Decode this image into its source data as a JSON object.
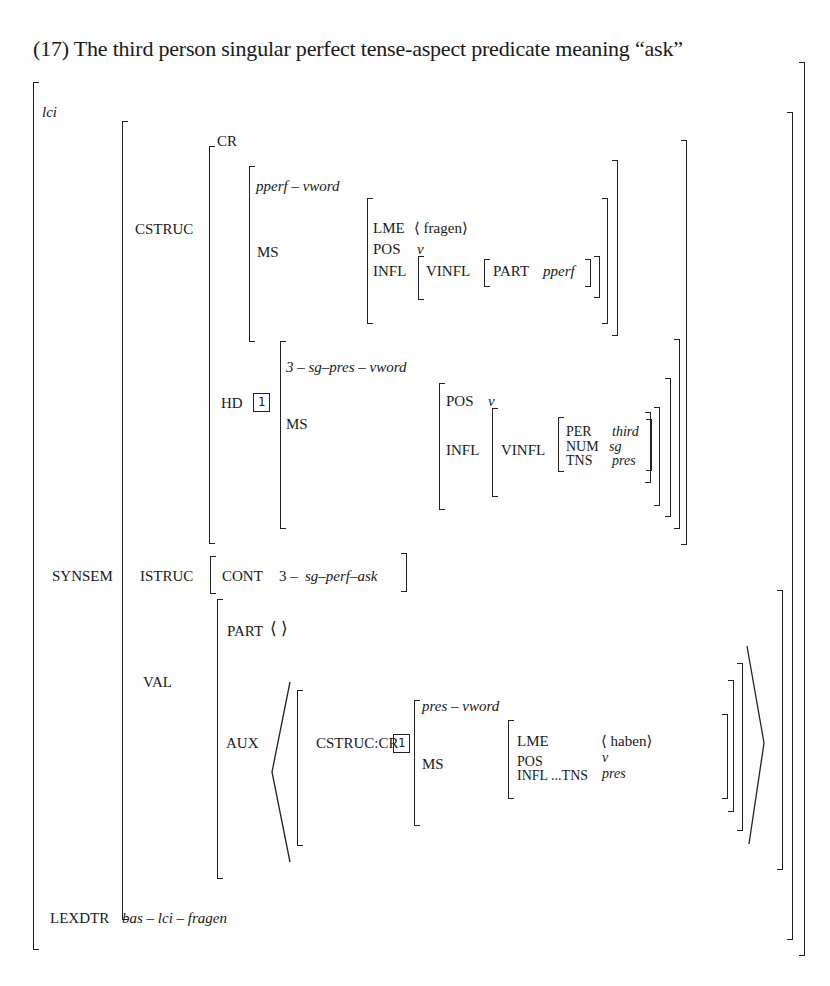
{
  "title": "(17) The third person singular perfect tense-aspect predicate meaning “ask”",
  "avm": {
    "type": "lci",
    "synsem_label": "SYNSEM",
    "cstruc": {
      "label": "CSTRUC",
      "cr": {
        "label": "CR",
        "type": "pperf – vword",
        "ms_label": "MS",
        "lme_label": "LME",
        "lme_value": "⟨ fragen⟩",
        "pos_label": "POS",
        "pos_value": "v",
        "infl_label": "INFL",
        "vinfl_label": "VINFL",
        "part_label": "PART",
        "part_value": "pperf"
      },
      "hd": {
        "label": "HD",
        "tag": "1",
        "type": "3 – sg–pres – vword",
        "ms_label": "MS",
        "pos_label": "POS",
        "pos_value": "v",
        "infl_label": "INFL",
        "vinfl_label": "VINFL",
        "per_label": "PER",
        "per_value": "third",
        "num_label": "NUM",
        "num_value": "sg",
        "tns_label": "TNS",
        "tns_value": "pres"
      }
    },
    "istruc": {
      "label": "ISTRUC",
      "cont_label": "CONT",
      "cont_prefix": "3 –",
      "cont_value": "sg–perf–ask"
    },
    "val": {
      "label": "VAL",
      "part_label": "PART",
      "part_value": "⟨ ⟩",
      "aux": {
        "label": "AUX",
        "path_label": "CSTRUC:CR",
        "tag": "1",
        "type": "pres – vword",
        "ms_label": "MS",
        "lme_label": "LME",
        "lme_value": "⟨ haben⟩",
        "pos_label": "POS",
        "pos_value": "v",
        "infl_label": "INFL ...TNS",
        "infl_value": "pres"
      }
    },
    "lexdtr": {
      "label": "LEXDTR",
      "value": "bas – lci – fragen"
    }
  }
}
